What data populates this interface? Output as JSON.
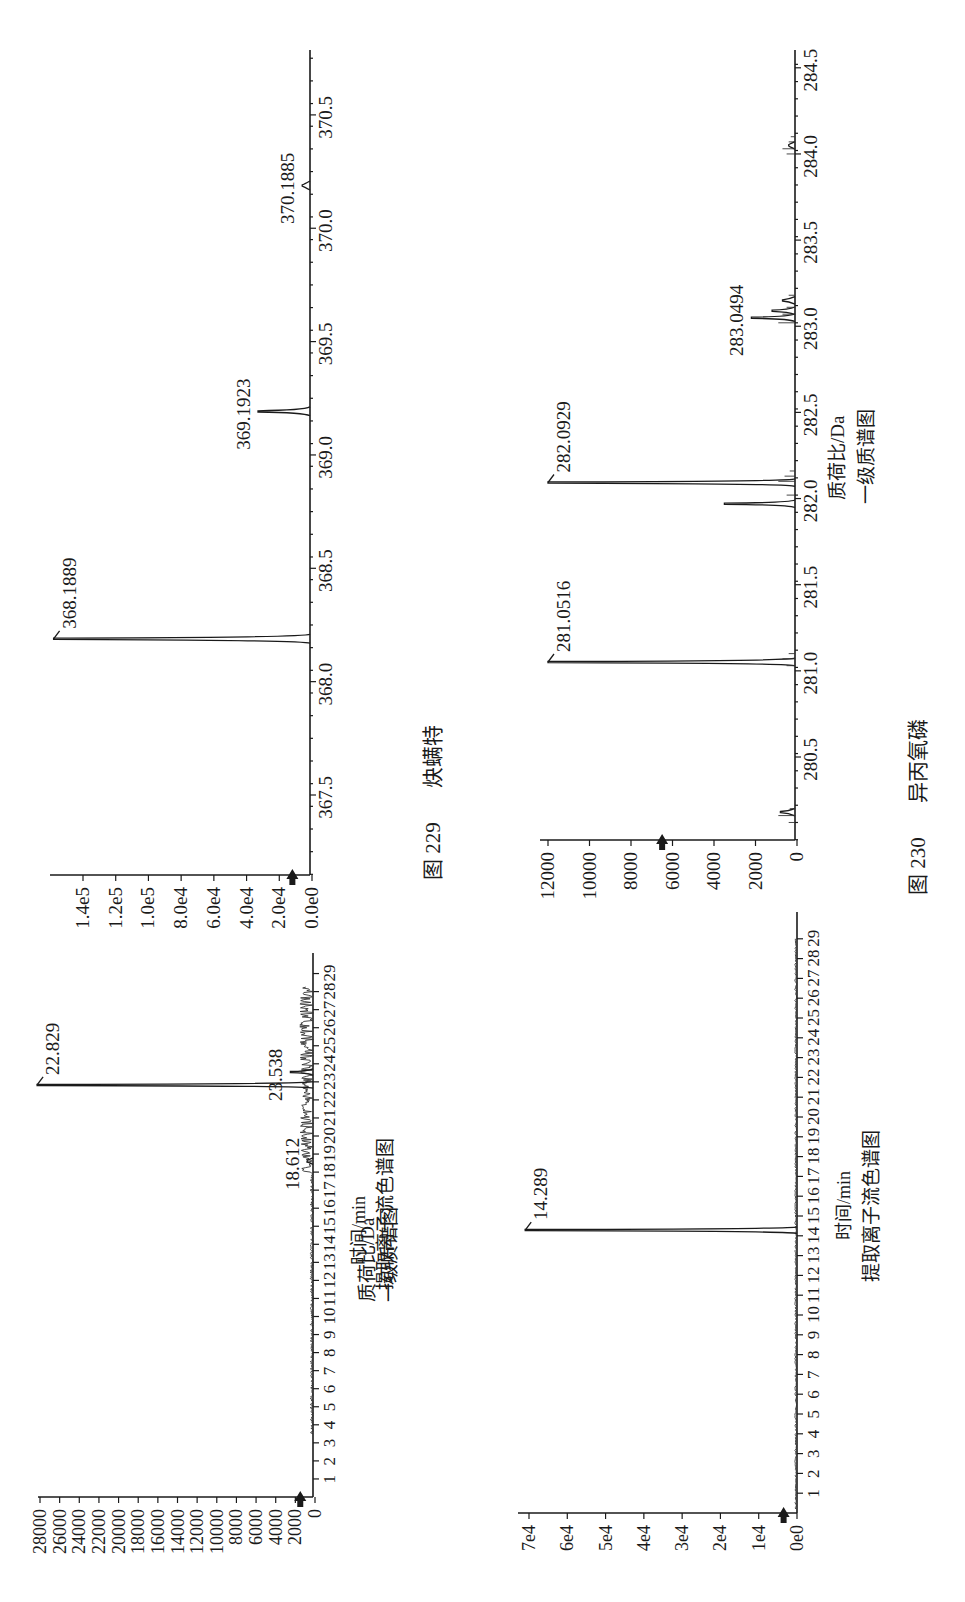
{
  "figures": [
    {
      "id": "fig229",
      "caption_number": "图 229",
      "caption_name": "炔螨特",
      "mass_spectrum": {
        "xlabel": "质荷比/Da",
        "title": "一级质谱图",
        "yticks": [
          "0.0e0",
          "2.0e4",
          "4.0e4",
          "6.0e4",
          "8.0e4",
          "1.0e5",
          "1.2e5",
          "1.4e5"
        ],
        "xticks": [
          "367.5",
          "368.0",
          "368.5",
          "369.0",
          "369.5",
          "370.0",
          "370.5"
        ],
        "peak_labels": [
          "368.1889",
          "369.1923",
          "370.1885"
        ]
      },
      "chromatogram": {
        "xlabel": "时间/min",
        "title": "提取离子流色谱图",
        "yticks": [
          "0",
          "2000",
          "4000",
          "6000",
          "8000",
          "10000",
          "12000",
          "14000",
          "16000",
          "18000",
          "20000",
          "22000",
          "24000",
          "26000",
          "28000"
        ],
        "xticks": [
          "1",
          "2",
          "3",
          "4",
          "5",
          "6",
          "7",
          "8",
          "9",
          "10",
          "11",
          "12",
          "13",
          "14",
          "15",
          "16",
          "17",
          "18",
          "19",
          "20",
          "21",
          "22",
          "23",
          "24",
          "25",
          "26",
          "27",
          "28",
          "29"
        ],
        "peak_labels": [
          "22.829",
          "23.538",
          "18.612"
        ]
      }
    },
    {
      "id": "fig230",
      "caption_number": "图 230",
      "caption_name": "异丙氧磷",
      "mass_spectrum": {
        "xlabel": "质荷比/Da",
        "title": "一级质谱图",
        "yticks": [
          "0",
          "2000",
          "4000",
          "6000",
          "8000",
          "10000",
          "12000"
        ],
        "xticks": [
          "280.5",
          "281.0",
          "281.5",
          "282.0",
          "282.5",
          "283.0",
          "283.5",
          "284.0",
          "284.5"
        ],
        "peak_labels": [
          "281.0516",
          "282.0929",
          "283.0494"
        ]
      },
      "chromatogram": {
        "xlabel": "时间/min",
        "title": "提取离子流色谱图",
        "yticks": [
          "0e0",
          "1e4",
          "2e4",
          "3e4",
          "4e4",
          "5e4",
          "6e4",
          "7e4"
        ],
        "xticks": [
          "1",
          "2",
          "3",
          "4",
          "5",
          "6",
          "7",
          "8",
          "9",
          "10",
          "11",
          "12",
          "13",
          "14",
          "15",
          "16",
          "17",
          "18",
          "19",
          "20",
          "21",
          "22",
          "23",
          "24",
          "25",
          "26",
          "27",
          "28",
          "29"
        ],
        "peak_labels": [
          "14.289"
        ]
      }
    }
  ],
  "chart_data": [
    {
      "type": "line",
      "title": "一级质谱图 (图 229 炔螨特)",
      "xlabel": "质荷比/Da",
      "ylabel": "",
      "orientation": "rotated 90° counter-clockwise (m/z axis vertical, intensity extends left)",
      "xlim": [
        367.15,
        370.8
      ],
      "ylim": [
        0,
        160000
      ],
      "xticks": [
        367.5,
        368.0,
        368.5,
        369.0,
        369.5,
        370.0,
        370.5
      ],
      "yticks": [
        0,
        20000,
        40000,
        60000,
        80000,
        100000,
        120000,
        140000
      ],
      "grid": false,
      "marker_arrow_at_y": 12000,
      "peaks": [
        {
          "mz": 368.1889,
          "intensity": 158000,
          "label": "368.1889"
        },
        {
          "mz": 369.1923,
          "intensity": 33000,
          "label": "369.1923"
        },
        {
          "mz": 370.1885,
          "intensity": 6000,
          "label": "370.1885"
        }
      ]
    },
    {
      "type": "line",
      "title": "提取离子流色谱图 (图 229 炔螨特)",
      "xlabel": "时间/min",
      "ylabel": "",
      "orientation": "rotated 90° counter-clockwise",
      "xlim": [
        0,
        29.5
      ],
      "ylim": [
        0,
        28500
      ],
      "xticks": [
        1,
        2,
        3,
        4,
        5,
        6,
        7,
        8,
        9,
        10,
        11,
        12,
        13,
        14,
        15,
        16,
        17,
        18,
        19,
        20,
        21,
        22,
        23,
        24,
        25,
        26,
        27,
        28,
        29
      ],
      "yticks": [
        0,
        2000,
        4000,
        6000,
        8000,
        10000,
        12000,
        14000,
        16000,
        18000,
        20000,
        22000,
        24000,
        26000,
        28000
      ],
      "grid": false,
      "marker_arrow_at_y": 1500,
      "peaks": [
        {
          "time": 22.829,
          "intensity": 28300,
          "label": "22.829"
        },
        {
          "time": 23.538,
          "intensity": 2500,
          "label": "23.538"
        },
        {
          "time": 18.612,
          "intensity": 800,
          "label": "18.612"
        }
      ],
      "baseline_noise": "noisy baseline ~200-1500 from 4 to 28 min, denser after 18 min"
    },
    {
      "type": "line",
      "title": "一级质谱图 (图 230 异丙氧磷)",
      "xlabel": "质荷比/Da",
      "ylabel": "",
      "orientation": "rotated 90° counter-clockwise",
      "xlim": [
        280.02,
        284.62
      ],
      "ylim": [
        0,
        12300
      ],
      "xticks": [
        280.5,
        281.0,
        281.5,
        282.0,
        282.5,
        283.0,
        283.5,
        284.0,
        284.5
      ],
      "yticks": [
        0,
        2000,
        4000,
        6000,
        8000,
        10000,
        12000
      ],
      "grid": false,
      "marker_arrow_at_y": 6500,
      "peaks": [
        {
          "mz": 280.18,
          "intensity": 800
        },
        {
          "mz": 281.0516,
          "intensity": 12000,
          "label": "281.0516"
        },
        {
          "mz": 281.97,
          "intensity": 3500
        },
        {
          "mz": 282.0929,
          "intensity": 12000,
          "label": "282.0929"
        },
        {
          "mz": 283.0494,
          "intensity": 2200,
          "label": "283.0494"
        },
        {
          "mz": 283.09,
          "intensity": 1200
        },
        {
          "mz": 283.15,
          "intensity": 700
        },
        {
          "mz": 284.05,
          "intensity": 400
        }
      ]
    },
    {
      "type": "line",
      "title": "提取离子流色谱图 (图 230 异丙氧磷)",
      "xlabel": "时间/min",
      "ylabel": "",
      "orientation": "rotated 90° counter-clockwise",
      "xlim": [
        0,
        29.5
      ],
      "ylim": [
        0,
        72000
      ],
      "xticks": [
        1,
        2,
        3,
        4,
        5,
        6,
        7,
        8,
        9,
        10,
        11,
        12,
        13,
        14,
        15,
        16,
        17,
        18,
        19,
        20,
        21,
        22,
        23,
        24,
        25,
        26,
        27,
        28,
        29
      ],
      "yticks": [
        0,
        10000,
        20000,
        30000,
        40000,
        50000,
        60000,
        70000
      ],
      "grid": false,
      "marker_arrow_at_y": 3500,
      "peaks": [
        {
          "time": 14.289,
          "intensity": 71000,
          "label": "14.289"
        }
      ]
    }
  ]
}
